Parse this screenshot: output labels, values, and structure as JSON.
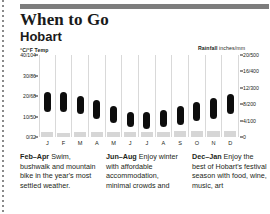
{
  "header": {
    "title": "When to Go",
    "subtitle": "Hobart"
  },
  "axes": {
    "temp_caption_bold": "°C/°F",
    "temp_caption_word": "Temp",
    "rain_caption_bold": "Rainfall",
    "rain_caption_word": "inches/mm"
  },
  "chart_data": {
    "type": "bar",
    "categories": [
      "J",
      "F",
      "M",
      "A",
      "M",
      "J",
      "J",
      "A",
      "S",
      "O",
      "N",
      "D"
    ],
    "month_names": [
      "January",
      "February",
      "March",
      "April",
      "May",
      "June",
      "July",
      "August",
      "September",
      "October",
      "November",
      "December"
    ],
    "xlabel": "",
    "ylabel": "°C/°F Temp",
    "y2label": "Rainfall inches/mm",
    "grid": false,
    "legend": "none",
    "ylim": [
      0,
      40
    ],
    "y2lim": [
      0,
      20
    ],
    "yticks": [
      {
        "value": 40,
        "label": "40/104"
      },
      {
        "value": 30,
        "label": "30/86"
      },
      {
        "value": 20,
        "label": "20/68"
      },
      {
        "value": 10,
        "label": "10/50"
      },
      {
        "value": 0,
        "label": "0/32"
      }
    ],
    "y2ticks": [
      {
        "value": 20,
        "label": "20/500"
      },
      {
        "value": 16,
        "label": "16/400"
      },
      {
        "value": 12,
        "label": "12/300"
      },
      {
        "value": 8,
        "label": "8/200"
      },
      {
        "value": 4,
        "label": "4/100"
      },
      {
        "value": 0,
        "label": "0"
      }
    ],
    "series": [
      {
        "name": "Temperature range",
        "type": "range-bar",
        "unit": "°C",
        "low": [
          12,
          12,
          11,
          9,
          7,
          5,
          4,
          5,
          6,
          8,
          9,
          11
        ],
        "high": [
          22,
          22,
          20,
          18,
          15,
          12,
          12,
          13,
          15,
          17,
          19,
          21
        ]
      },
      {
        "name": "Rainfall",
        "type": "bar",
        "unit": "inches",
        "values": [
          1.9,
          1.6,
          1.8,
          2.0,
          1.9,
          2.1,
          2.0,
          2.1,
          2.2,
          2.4,
          2.3,
          2.3
        ]
      }
    ]
  },
  "notes": [
    {
      "range": "Feb–Apr",
      "text": " Swim, bushwalk and mountain bike in the year's most settled weather."
    },
    {
      "range": "Jun–Aug",
      "text": " Enjoy winter with affordable accommodation, minimal crowds and"
    },
    {
      "range": "Dec–Jan",
      "text": " Enjoy the best of Hobart's festival season with food, wine, music, art"
    }
  ]
}
